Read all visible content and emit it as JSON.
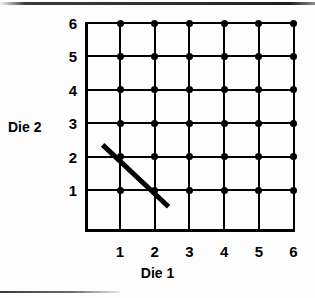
{
  "figure": {
    "background_color": "#fdfdfd",
    "ink_color": "#000000"
  },
  "axes": {
    "x_title": "Die 1",
    "y_title": "Die 2",
    "x_ticks": [
      "1",
      "2",
      "3",
      "4",
      "5",
      "6"
    ],
    "y_ticks": [
      "6",
      "5",
      "4",
      "3",
      "2",
      "1"
    ]
  },
  "chart_data": {
    "type": "scatter",
    "title": "",
    "subtitle": "",
    "xlabel": "Die 1",
    "ylabel": "Die 2",
    "xlim": [
      0,
      6.5
    ],
    "ylim": [
      0,
      6.5
    ],
    "x_tick_values": [
      1,
      2,
      3,
      4,
      5,
      6
    ],
    "y_tick_values": [
      1,
      2,
      3,
      4,
      5,
      6
    ],
    "grid": true,
    "legend": "none",
    "series": [
      {
        "name": "sample space",
        "marker": "filled-circle",
        "color": "#000000",
        "points": [
          [
            1,
            1
          ],
          [
            1,
            2
          ],
          [
            1,
            3
          ],
          [
            1,
            4
          ],
          [
            1,
            5
          ],
          [
            1,
            6
          ],
          [
            2,
            1
          ],
          [
            2,
            2
          ],
          [
            2,
            3
          ],
          [
            2,
            4
          ],
          [
            2,
            5
          ],
          [
            2,
            6
          ],
          [
            3,
            1
          ],
          [
            3,
            2
          ],
          [
            3,
            3
          ],
          [
            3,
            4
          ],
          [
            3,
            5
          ],
          [
            3,
            6
          ],
          [
            4,
            1
          ],
          [
            4,
            2
          ],
          [
            4,
            3
          ],
          [
            4,
            4
          ],
          [
            4,
            5
          ],
          [
            4,
            6
          ],
          [
            5,
            1
          ],
          [
            5,
            2
          ],
          [
            5,
            3
          ],
          [
            5,
            4
          ],
          [
            5,
            5
          ],
          [
            5,
            6
          ],
          [
            6,
            1
          ],
          [
            6,
            2
          ],
          [
            6,
            3
          ],
          [
            6,
            4
          ],
          [
            6,
            5
          ],
          [
            6,
            6
          ]
        ]
      }
    ],
    "annotations": [
      {
        "type": "line-segment",
        "name": "event-line",
        "color": "#000000",
        "width_px": 5,
        "x_start": 0.5,
        "y_start": 2.35,
        "x_end": 2.4,
        "y_end": 0.5,
        "covers_points": [
          [
            1,
            2
          ],
          [
            2,
            1
          ]
        ]
      }
    ]
  }
}
